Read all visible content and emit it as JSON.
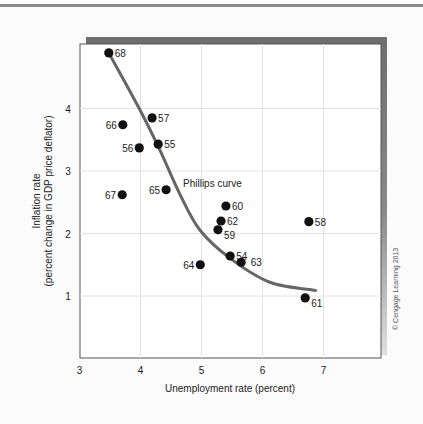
{
  "chart_data": {
    "type": "scatter",
    "title": "",
    "xlabel": "Unemployment rate (percent)",
    "ylabel_line1": "Inflation rate",
    "ylabel_line2": "(percent change in GDP price deflator)",
    "xlim": [
      3,
      8
    ],
    "ylim": [
      0,
      5
    ],
    "x_ticks": [
      3,
      4,
      5,
      6,
      7
    ],
    "y_ticks": [
      1,
      2,
      3,
      4
    ],
    "grid": true,
    "legend": null,
    "annotation": "Phillips curve",
    "credit": "© Cengage Learning 2013",
    "series": [
      {
        "name": "Year (19xx)",
        "points": [
          {
            "label": "54",
            "x": 5.47,
            "y": 1.64,
            "lx": 1,
            "ly": 0
          },
          {
            "label": "55",
            "x": 4.29,
            "y": 3.43,
            "lx": 1,
            "ly": 0
          },
          {
            "label": "56",
            "x": 3.98,
            "y": 3.37,
            "lx": -1,
            "ly": 0
          },
          {
            "label": "57",
            "x": 4.19,
            "y": 3.85,
            "lx": 1,
            "ly": 0
          },
          {
            "label": "58",
            "x": 6.76,
            "y": 2.19,
            "lx": 1,
            "ly": 0
          },
          {
            "label": "59",
            "x": 5.27,
            "y": 2.06,
            "lx": 1,
            "ly": 1
          },
          {
            "label": "60",
            "x": 5.4,
            "y": 2.44,
            "lx": 1,
            "ly": 0
          },
          {
            "label": "61",
            "x": 6.7,
            "y": 0.97,
            "lx": 1,
            "ly": 1
          },
          {
            "label": "62",
            "x": 5.32,
            "y": 2.2,
            "lx": 1,
            "ly": 0
          },
          {
            "label": "63",
            "x": 5.65,
            "y": 1.54,
            "lx": 1.6,
            "ly": 0
          },
          {
            "label": "64",
            "x": 4.98,
            "y": 1.5,
            "lx": -1,
            "ly": 0
          },
          {
            "label": "65",
            "x": 4.42,
            "y": 2.7,
            "lx": -1,
            "ly": 0
          },
          {
            "label": "66",
            "x": 3.71,
            "y": 3.74,
            "lx": -1,
            "ly": 0
          },
          {
            "label": "67",
            "x": 3.7,
            "y": 2.62,
            "lx": -1,
            "ly": 0
          },
          {
            "label": "68",
            "x": 3.48,
            "y": 4.89,
            "lx": 1,
            "ly": 0
          }
        ]
      }
    ],
    "curve": {
      "name": "Phillips curve",
      "points": [
        [
          3.48,
          4.89
        ],
        [
          3.99,
          3.98
        ],
        [
          4.32,
          3.33
        ],
        [
          4.65,
          2.62
        ],
        [
          4.97,
          2.06
        ],
        [
          5.46,
          1.61
        ],
        [
          6.12,
          1.22
        ],
        [
          6.87,
          1.09
        ]
      ]
    }
  },
  "colors": {
    "background": "#fbfbfb",
    "plot_bg": "#ffffff",
    "shadow": "#6e6e6e",
    "grid": "#e2e2e2",
    "axis": "#555555",
    "point": "#111111",
    "curve": "#666666"
  }
}
